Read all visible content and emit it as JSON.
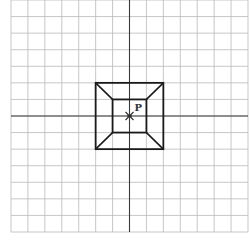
{
  "diagram": {
    "title": "",
    "grid": {
      "cols": 14,
      "rows": 14,
      "x0": 11,
      "y0": 0,
      "x1": 248,
      "y1": 232,
      "line_color": "#b9b9b9"
    },
    "axes": {
      "x_axis_row": 7,
      "y_axis_col": 7,
      "color": "#3a3a3a"
    },
    "outer_square": {
      "col_from": 5,
      "col_to": 9,
      "row_from": 5,
      "row_to": 9
    },
    "inner_square": {
      "col_from": 6,
      "col_to": 8,
      "row_from": 6,
      "row_to": 8
    },
    "center_point": {
      "label": "P",
      "col": 7,
      "row": 7,
      "marker": "star-cross"
    },
    "shape_color": "#1a1a1a"
  }
}
